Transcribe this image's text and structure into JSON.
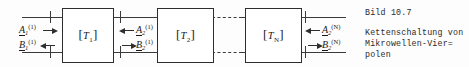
{
  "figure": {
    "boxes": [
      {
        "name": "T1",
        "letter": "T",
        "index": "1"
      },
      {
        "name": "T2",
        "letter": "T",
        "index": "2"
      },
      {
        "name": "TN",
        "letter": "T",
        "index": "N"
      }
    ],
    "ports": [
      {
        "id": "input-port-1",
        "incident": {
          "symbol": "A",
          "sub": "1",
          "sup": "(1)",
          "direction": "right"
        },
        "reflected": {
          "symbol": "B",
          "sub": "1",
          "sup": "(1)",
          "direction": "left"
        }
      },
      {
        "id": "inter-port-1",
        "incident": {
          "symbol": "A",
          "sub": "2",
          "sup": "(1)",
          "direction": "left"
        },
        "reflected": {
          "symbol": "B",
          "sub": "2",
          "sup": "(1)",
          "direction": "right"
        }
      },
      {
        "id": "output-port-N",
        "incident": {
          "symbol": "A",
          "sub": "2",
          "sup": "(N)",
          "direction": "left"
        },
        "reflected": {
          "symbol": "B",
          "sub": "2",
          "sup": "(N)",
          "direction": "right"
        }
      }
    ],
    "continuation": "dashed"
  },
  "caption": {
    "number": "Bild 10.7",
    "line1": "Kettenschaltung von",
    "line2": "Mikrowellen-Vier=",
    "line3": "polen"
  },
  "colors": {
    "ink": "#2e2e2e",
    "paper": "#fdfdfd"
  }
}
